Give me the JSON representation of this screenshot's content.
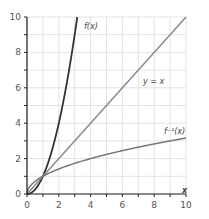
{
  "chart_data": {
    "type": "line",
    "title": "",
    "xlabel": "x",
    "ylabel": "",
    "xlim": [
      0,
      10
    ],
    "ylim": [
      0,
      10
    ],
    "grid": true,
    "x_ticks": [
      0,
      2,
      4,
      6,
      8,
      10
    ],
    "y_ticks": [
      0,
      2,
      4,
      6,
      8,
      10
    ],
    "x_minor_ticks": [
      1,
      3,
      5,
      7,
      9
    ],
    "y_minor_ticks": [
      1,
      3,
      5,
      7,
      9
    ],
    "series": [
      {
        "name": "f(x)",
        "label": "f(x)",
        "color": "#333333",
        "x": [
          0,
          0.5,
          1,
          1.5,
          2,
          2.5,
          3,
          3.16
        ],
        "y": [
          0,
          0.25,
          1,
          2.25,
          4,
          6.25,
          9,
          10
        ]
      },
      {
        "name": "y = x",
        "label": "y = x",
        "color": "#8a8a8a",
        "x": [
          0,
          10
        ],
        "y": [
          0,
          10
        ]
      },
      {
        "name": "f^-1(x)",
        "label": "f⁻¹(x)",
        "color": "#777777",
        "x": [
          0,
          0.25,
          1,
          2.25,
          4,
          6.25,
          9,
          10
        ],
        "y": [
          0,
          0.5,
          1,
          1.5,
          2,
          2.5,
          3,
          3.16
        ]
      }
    ],
    "annotations": [
      {
        "text": "f(x)",
        "x": 3.7,
        "y": 9.4
      },
      {
        "text": "y = x",
        "x": 7.3,
        "y": 6.2
      },
      {
        "text": "f⁻¹(x)",
        "x": 8.7,
        "y": 3.7
      }
    ]
  },
  "labels": {
    "x_axis": "x",
    "f": "f(x)",
    "identity": "y = x",
    "finv": "f⁻¹(x)"
  }
}
